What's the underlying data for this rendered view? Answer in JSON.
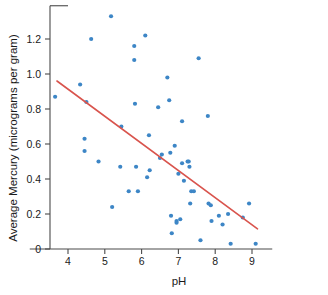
{
  "chart_data": {
    "type": "scatter",
    "title": "",
    "xlabel": "pH",
    "ylabel": "Average Mercury (micrograms per gram)",
    "xlim": [
      3.45,
      9.55
    ],
    "ylim": [
      -0.02,
      1.39
    ],
    "xticks": [
      4,
      5,
      6,
      7,
      8,
      9
    ],
    "xtick_labels": [
      "4",
      "5",
      "6",
      "7",
      "8",
      "9"
    ],
    "yticks": [
      0,
      0.2,
      0.4,
      0.6,
      0.8,
      1.0,
      1.2
    ],
    "ytick_labels": [
      "0",
      "0.2",
      "0.4",
      "0.6",
      "0.8",
      "1.0",
      "1.2"
    ],
    "grid": false,
    "legend": null,
    "point_color": "#3d86c6",
    "line_color": "#d9544d",
    "axis_color": "#4a4a4a",
    "series": [
      {
        "name": "Lakes",
        "marker": "circle",
        "points": [
          [
            3.65,
            0.87
          ],
          [
            4.33,
            0.94
          ],
          [
            4.45,
            0.63
          ],
          [
            4.45,
            0.56
          ],
          [
            4.5,
            0.84
          ],
          [
            4.63,
            1.2
          ],
          [
            4.83,
            0.5
          ],
          [
            5.17,
            1.33
          ],
          [
            5.2,
            0.24
          ],
          [
            5.42,
            0.47
          ],
          [
            5.45,
            0.7
          ],
          [
            5.65,
            0.33
          ],
          [
            5.8,
            1.16
          ],
          [
            5.8,
            1.08
          ],
          [
            5.82,
            0.83
          ],
          [
            5.85,
            0.47
          ],
          [
            5.9,
            0.33
          ],
          [
            6.1,
            1.22
          ],
          [
            6.15,
            0.41
          ],
          [
            6.2,
            0.65
          ],
          [
            6.22,
            0.45
          ],
          [
            6.45,
            0.81
          ],
          [
            6.5,
            0.52
          ],
          [
            6.55,
            0.54
          ],
          [
            6.7,
            0.98
          ],
          [
            6.75,
            0.85
          ],
          [
            6.78,
            0.55
          ],
          [
            6.8,
            0.19
          ],
          [
            6.82,
            0.09
          ],
          [
            6.9,
            0.59
          ],
          [
            6.95,
            0.16
          ],
          [
            6.95,
            0.15
          ],
          [
            7.0,
            0.43
          ],
          [
            7.05,
            0.17
          ],
          [
            7.1,
            0.73
          ],
          [
            7.1,
            0.49
          ],
          [
            7.15,
            0.39
          ],
          [
            7.25,
            0.5
          ],
          [
            7.28,
            0.5
          ],
          [
            7.3,
            0.47
          ],
          [
            7.32,
            0.26
          ],
          [
            7.35,
            0.33
          ],
          [
            7.42,
            0.33
          ],
          [
            7.55,
            1.09
          ],
          [
            7.6,
            0.05
          ],
          [
            7.8,
            0.76
          ],
          [
            7.82,
            0.26
          ],
          [
            7.88,
            0.25
          ],
          [
            7.9,
            0.16
          ],
          [
            8.1,
            0.19
          ],
          [
            8.2,
            0.14
          ],
          [
            8.35,
            0.2
          ],
          [
            8.42,
            0.03
          ],
          [
            8.75,
            0.18
          ],
          [
            8.92,
            0.26
          ],
          [
            9.1,
            0.03
          ]
        ]
      }
    ],
    "trend_line": {
      "name": "least-squares fit",
      "x_start": 3.7,
      "y_start": 0.96,
      "x_end": 9.15,
      "y_end": 0.115
    }
  }
}
